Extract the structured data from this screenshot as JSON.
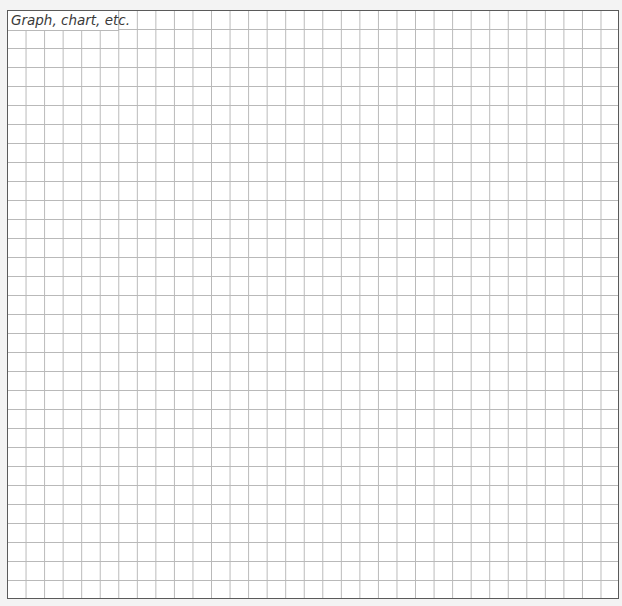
{
  "worksheet": {
    "graph_area": {
      "label": "Graph, chart, etc.",
      "grid": {
        "columns": 33,
        "rows": 31
      }
    }
  }
}
